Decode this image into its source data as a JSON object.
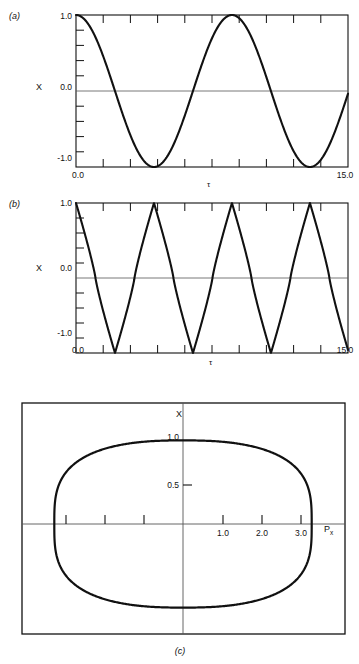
{
  "figure": {
    "panels": [
      {
        "id": "a",
        "label": "(a)",
        "y_axis_label": "X",
        "x_axis_label": "τ",
        "y_ticks": [
          "1.0",
          "0.0",
          "-1.0"
        ],
        "x_ticks": [
          "0.0",
          "15.0"
        ]
      },
      {
        "id": "b",
        "label": "(b)",
        "y_axis_label": "X",
        "x_axis_label": "τ",
        "y_ticks": [
          "1.0",
          "0.0",
          "-1.0"
        ],
        "x_ticks": [
          "0.0",
          "15.0"
        ]
      },
      {
        "id": "c",
        "label": "(c)",
        "y_axis_label": "X",
        "x_axis_label": "P",
        "x_axis_label_sub": "x",
        "y_ticks": [
          "1.0",
          "0.5"
        ],
        "x_ticks": [
          "1.0",
          "2.0",
          "3.0"
        ]
      }
    ]
  },
  "chart_data": [
    {
      "type": "line",
      "id": "panel-a",
      "title": "",
      "xlabel": "τ",
      "ylabel": "X",
      "xlim": [
        0.0,
        15.0
      ],
      "ylim": [
        -1.0,
        1.0
      ],
      "xticklabels": [
        "0.0",
        "15.0"
      ],
      "yticklabels": [
        "1.0",
        "0.0",
        "-1.0"
      ],
      "grid": false,
      "legend": "none",
      "series": [
        {
          "name": "X(τ) harmonic",
          "description": "cosine oscillation, amplitude 1.0, period about 8.6",
          "x": [
            0.0,
            0.43,
            0.86,
            1.29,
            1.72,
            2.15,
            2.58,
            3.01,
            3.44,
            3.87,
            4.3,
            4.73,
            5.16,
            5.59,
            6.02,
            6.45,
            6.88,
            7.31,
            7.74,
            8.17,
            8.6,
            9.03,
            9.46,
            9.89,
            10.32,
            10.75,
            11.18,
            11.61,
            12.04,
            12.47,
            12.9,
            13.33,
            13.76,
            14.19,
            14.62,
            15.0
          ],
          "y": [
            1.0,
            0.95,
            0.81,
            0.59,
            0.31,
            0.0,
            -0.31,
            -0.59,
            -0.81,
            -0.95,
            -1.0,
            -0.95,
            -0.81,
            -0.59,
            -0.31,
            0.0,
            0.31,
            0.59,
            0.81,
            0.95,
            1.0,
            0.95,
            0.81,
            0.59,
            0.31,
            0.0,
            -0.31,
            -0.59,
            -0.81,
            -0.95,
            -1.0,
            -0.95,
            -0.81,
            -0.59,
            -0.31,
            -0.04
          ]
        }
      ]
    },
    {
      "type": "line",
      "id": "panel-b",
      "title": "",
      "xlabel": "τ",
      "ylabel": "X",
      "xlim": [
        0.0,
        15.0
      ],
      "ylim": [
        -1.0,
        1.0
      ],
      "xticklabels": [
        "0.0",
        "15.0"
      ],
      "yticklabels": [
        "1.0",
        "0.0",
        "-1.0"
      ],
      "grid": false,
      "legend": "none",
      "series": [
        {
          "name": "X(τ) anharmonic",
          "description": "cusped triangular oscillation, amplitude 1.0, period about 4.3, approximately 3.5 cycles",
          "period": 4.3,
          "x": [
            0.0,
            0.54,
            1.08,
            1.61,
            2.15,
            2.69,
            3.23,
            3.76,
            4.3,
            4.84,
            5.38,
            5.91,
            6.45,
            6.99,
            7.53,
            8.06,
            8.6,
            9.14,
            9.68,
            10.21,
            10.75,
            11.29,
            11.83,
            12.36,
            12.9,
            13.44,
            13.98,
            14.51,
            15.0
          ],
          "y": [
            1.0,
            0.5,
            0.0,
            -0.5,
            -1.0,
            -0.5,
            0.0,
            0.5,
            1.0,
            0.5,
            0.0,
            -0.5,
            -1.0,
            -0.5,
            0.0,
            0.5,
            1.0,
            0.5,
            0.0,
            -0.5,
            -1.0,
            -0.5,
            0.0,
            0.5,
            1.0,
            0.5,
            0.0,
            -0.5,
            -0.1
          ]
        }
      ]
    },
    {
      "type": "line",
      "id": "panel-c",
      "title": "",
      "xlabel": "Px",
      "ylabel": "X",
      "xlim": [
        -3.4,
        3.4
      ],
      "ylim": [
        -1.15,
        1.15
      ],
      "xticklabels": [
        "1.0",
        "2.0",
        "3.0"
      ],
      "yticklabels": [
        "1.0",
        "0.5"
      ],
      "grid": false,
      "legend": "none",
      "series": [
        {
          "name": "phase-space orbit",
          "description": "closed oval trajectory in the X vs Px plane, horizontal extent about ±3.3, vertical extent about ±0.95, slightly pointed at the right",
          "x_extent": [
            -3.3,
            3.3
          ],
          "y_extent": [
            -0.95,
            0.95
          ]
        }
      ]
    }
  ]
}
